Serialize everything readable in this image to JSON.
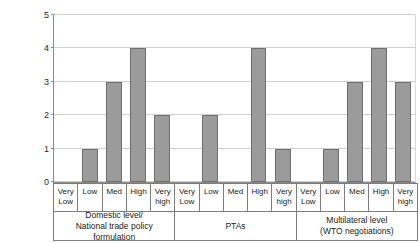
{
  "chart_data": {
    "type": "bar",
    "title": "",
    "xlabel": "",
    "ylabel": "",
    "ylim": [
      0,
      5
    ],
    "yticks": [
      "0",
      "1",
      "2",
      "3",
      "4",
      "5"
    ],
    "grid": true,
    "legend": "none",
    "categories": [
      "Very Low",
      "Low",
      "Med",
      "High",
      "Very high"
    ],
    "groups": [
      {
        "label_line1": "Domestic level/",
        "label_line2": "National trade policy formulation",
        "values": [
          0,
          1,
          3,
          4,
          2
        ]
      },
      {
        "label_line1": "PTAs",
        "label_line2": "",
        "values": [
          0,
          2,
          0,
          4,
          1
        ]
      },
      {
        "label_line1": "Multilateral level",
        "label_line2": "(WTO negotiations)",
        "values": [
          0,
          1,
          3,
          4,
          3
        ]
      }
    ],
    "bar_color": "#9b9b9b",
    "bar_border_color": "#6f6f6f",
    "gridline_color": "#cfcfcf",
    "axis_color": "#8a8a8a"
  }
}
